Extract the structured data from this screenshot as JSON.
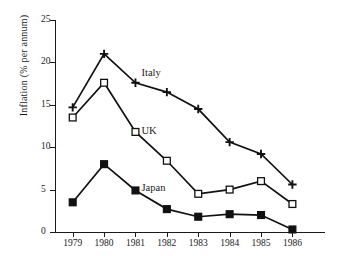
{
  "chart_data": {
    "type": "line",
    "title": "",
    "xlabel": "",
    "ylabel": "Inflation (% per annum)",
    "categories": [
      "1979",
      "1980",
      "1981",
      "1982",
      "1983",
      "1984",
      "1985",
      "1986"
    ],
    "ylim": [
      0,
      25
    ],
    "yticks": [
      0,
      5,
      10,
      15,
      20,
      25
    ],
    "ytick_labels": [
      "0",
      "5",
      "10",
      "15",
      "20",
      "25"
    ],
    "grid": false,
    "legend": "inline-series-labels",
    "series": [
      {
        "name": "Italy",
        "marker": "plus",
        "values": [
          14.7,
          21.0,
          17.6,
          16.5,
          14.5,
          10.6,
          9.2,
          5.6
        ],
        "label_x": 1981,
        "label_value": 18.6
      },
      {
        "name": "UK",
        "marker": "open-square",
        "values": [
          13.5,
          17.6,
          11.8,
          8.4,
          4.5,
          5.0,
          6.0,
          3.3
        ],
        "label_x": 1981,
        "label_value": 11.8
      },
      {
        "name": "Japan",
        "marker": "filled-square",
        "values": [
          3.5,
          8.0,
          4.9,
          2.7,
          1.8,
          2.1,
          2.0,
          0.3
        ],
        "label_x": 1981,
        "label_value": 5.1
      }
    ]
  }
}
